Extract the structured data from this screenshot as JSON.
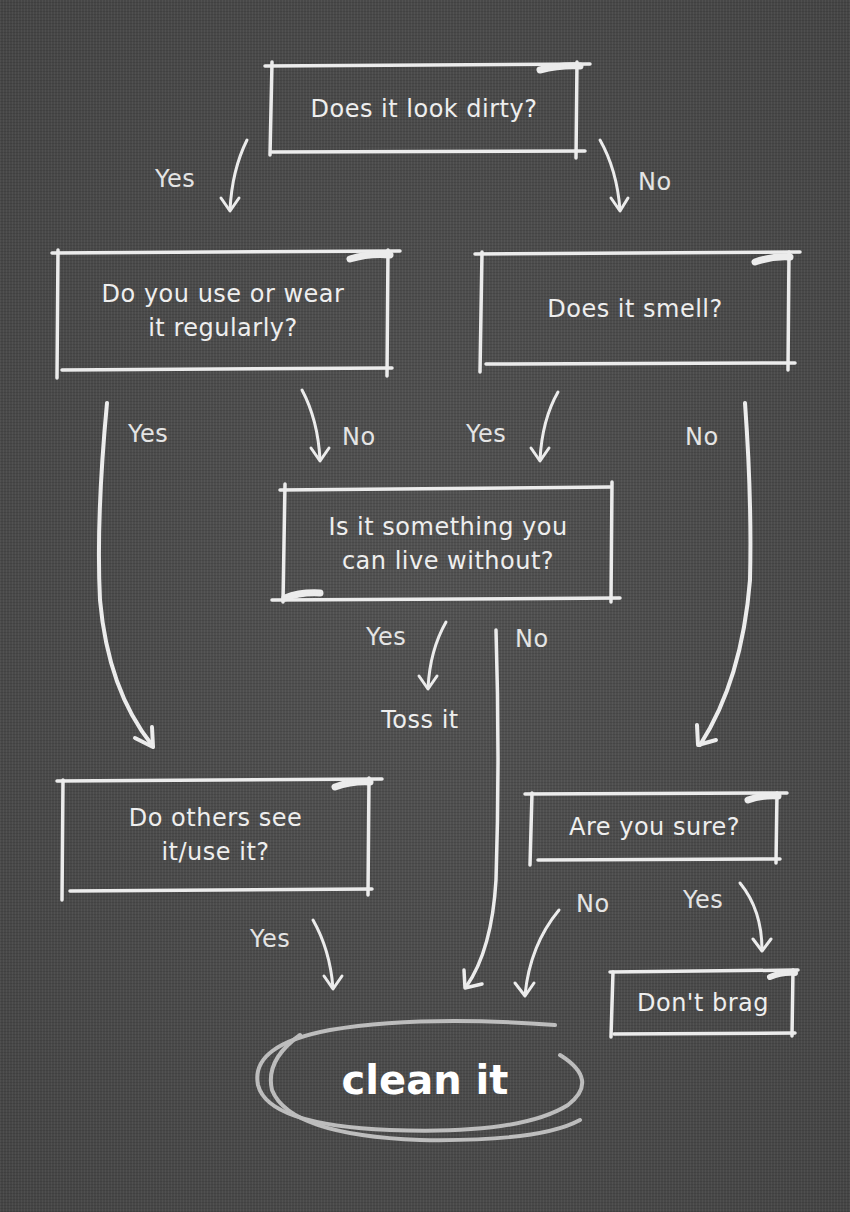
{
  "colors": {
    "background": "#4d4d4d",
    "chalk": "#eeeeee",
    "chalk_dim": "#c8c8c8"
  },
  "nodes": {
    "q_dirty": {
      "text": "Does it look dirty?"
    },
    "q_use": {
      "line1": "Do you use or wear",
      "line2": "it regularly?"
    },
    "q_smell": {
      "text": "Does it smell?"
    },
    "q_live_without": {
      "line1": "Is it something you",
      "line2": "can live without?"
    },
    "q_others": {
      "line1": "Do others see",
      "line2": "it/use it?"
    },
    "q_sure": {
      "text": "Are you sure?"
    },
    "r_toss": {
      "text": "Toss it"
    },
    "r_dont_brag": {
      "text": "Don't brag"
    },
    "r_clean": {
      "text": "clean it"
    }
  },
  "edges": [
    {
      "from": "q_dirty",
      "to": "q_use",
      "label": "Yes"
    },
    {
      "from": "q_dirty",
      "to": "q_smell",
      "label": "No"
    },
    {
      "from": "q_use",
      "to": "q_others",
      "label": "Yes"
    },
    {
      "from": "q_use",
      "to": "q_live_without",
      "label": "No"
    },
    {
      "from": "q_smell",
      "to": "q_live_without",
      "label": "Yes"
    },
    {
      "from": "q_smell",
      "to": "q_sure",
      "label": "No"
    },
    {
      "from": "q_live_without",
      "to": "r_toss",
      "label": "Yes"
    },
    {
      "from": "q_live_without",
      "to": "r_clean",
      "label": "No"
    },
    {
      "from": "q_others",
      "to": "r_clean",
      "label": "Yes"
    },
    {
      "from": "q_sure",
      "to": "r_clean",
      "label": "No"
    },
    {
      "from": "q_sure",
      "to": "r_dont_brag",
      "label": "Yes"
    }
  ]
}
